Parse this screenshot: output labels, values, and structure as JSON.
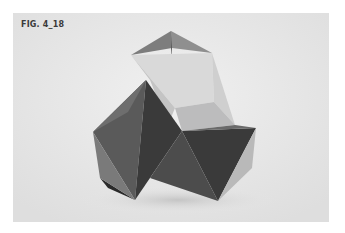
{
  "figure": {
    "label": "FIG. 4_18",
    "colors": {
      "page_background": "#ffffff",
      "panel_background": "#e9e9e9",
      "face_light": "#d6d6d6",
      "face_mid": "#9a9a9a",
      "face_dark": "#4a4a4a",
      "face_darkest": "#2e2e2e"
    }
  }
}
